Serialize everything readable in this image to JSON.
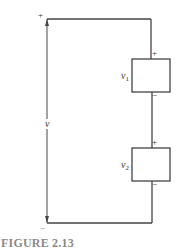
{
  "figure": {
    "caption": "FIGURE 2.13",
    "colors": {
      "wire": "#444444",
      "text": "#333333",
      "caption": "#8a8a8a",
      "background": "#ffffff"
    }
  },
  "circuit": {
    "total_voltage": {
      "label": "v",
      "plus": "+",
      "minus": "−"
    },
    "elements": [
      {
        "label": "v",
        "subscript": "1",
        "plus": "+",
        "minus": "−"
      },
      {
        "label": "v",
        "subscript": "2",
        "plus": "+",
        "minus": "−"
      }
    ]
  }
}
